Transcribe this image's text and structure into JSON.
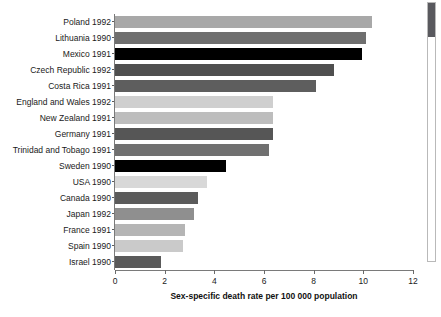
{
  "chart_data": {
    "type": "bar",
    "orientation": "horizontal",
    "title": "",
    "xlabel": "Sex-specific death rate per 100 000 population",
    "ylabel": "",
    "xlim": [
      0,
      12
    ],
    "xticks": [
      0,
      2,
      4,
      6,
      8,
      10,
      12
    ],
    "xticklabels": [
      "0",
      "2",
      "4",
      "6",
      "8",
      "10",
      "12"
    ],
    "grid": false,
    "legend": null,
    "categories": [
      "Poland 1992",
      "Lithuania 1990",
      "Mexico 1991",
      "Czech Republic 1992",
      "Costa Rica 1991",
      "England and Wales 1992",
      "New Zealand 1991",
      "Germany 1991",
      "Trinidad and Tobago 1991",
      "Sweden 1990",
      "USA 1990",
      "Canada 1990",
      "Japan 1992",
      "France 1991",
      "Spain 1990",
      "Israel 1990"
    ],
    "values": [
      10.35,
      10.1,
      9.95,
      8.8,
      8.1,
      6.35,
      6.35,
      6.35,
      6.2,
      4.45,
      3.7,
      3.35,
      3.2,
      2.8,
      2.75,
      1.85
    ],
    "bar_colors": [
      "#a8a8a8",
      "#6f6f6f",
      "#000000",
      "#4f4f4f",
      "#5e5e5e",
      "#cfcfcf",
      "#bdbdbd",
      "#565656",
      "#707070",
      "#000000",
      "#d8d8d8",
      "#5b5b5b",
      "#8f8f8f",
      "#b5b5b5",
      "#cacaca",
      "#5a5a5a"
    ]
  },
  "scrollbar": {
    "name": "vertical-scrollbar",
    "thumb_position": "top"
  }
}
